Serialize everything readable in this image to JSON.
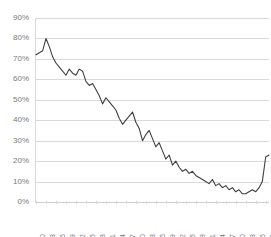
{
  "chart_data": {
    "type": "line",
    "title": "",
    "subtitle": "",
    "xlabel": "",
    "ylabel": "",
    "ylim": [
      0,
      90
    ],
    "y_ticks": [
      0,
      10,
      20,
      30,
      40,
      50,
      60,
      70,
      80,
      90
    ],
    "y_tick_labels": [
      "0%",
      "10%",
      "20%",
      "30%",
      "40%",
      "50%",
      "60%",
      "70%",
      "80%",
      "90%"
    ],
    "grid": true,
    "legend": null,
    "legend_position": "none",
    "x_tick_labels": [
      "1950",
      "1953",
      "1956",
      "1959",
      "1962",
      "1965",
      "1968",
      "1971",
      "1974",
      "1977",
      "1980",
      "1983",
      "1986",
      "1989",
      "1992",
      "1995",
      "1998",
      "2001",
      "2004",
      "2007",
      "2010",
      "2013",
      "2016",
      "2019"
    ],
    "xlim": [
      1950,
      2020
    ],
    "line_color": "#404040",
    "line_width": 1.1,
    "x": [
      1950,
      1951,
      1952,
      1953,
      1954,
      1955,
      1956,
      1957,
      1958,
      1959,
      1960,
      1961,
      1962,
      1963,
      1964,
      1965,
      1966,
      1967,
      1968,
      1969,
      1970,
      1971,
      1972,
      1973,
      1974,
      1975,
      1976,
      1977,
      1978,
      1979,
      1980,
      1981,
      1982,
      1983,
      1984,
      1985,
      1986,
      1987,
      1988,
      1989,
      1990,
      1991,
      1992,
      1993,
      1994,
      1995,
      1996,
      1997,
      1998,
      1999,
      2000,
      2001,
      2002,
      2003,
      2004,
      2005,
      2006,
      2007,
      2008,
      2009,
      2010,
      2011,
      2012,
      2013,
      2014,
      2015,
      2016,
      2017,
      2018,
      2019,
      2020
    ],
    "values": [
      72,
      73,
      74,
      80,
      76,
      71,
      68,
      66,
      64,
      62,
      65,
      63,
      62,
      65,
      64,
      59,
      57,
      58,
      55,
      52,
      48,
      51,
      49,
      47,
      45,
      41,
      38,
      40,
      42,
      44,
      39,
      36,
      30,
      33,
      35,
      31,
      27,
      29,
      25,
      21,
      23,
      18,
      20,
      17,
      15,
      16,
      14,
      15,
      13,
      12,
      11,
      10,
      9,
      11,
      8,
      9,
      7,
      8,
      6,
      7,
      5,
      6,
      4,
      4,
      5,
      6,
      5,
      7,
      10,
      22,
      23
    ],
    "value_unit": "%",
    "series": [
      {
        "name": "",
        "values": [
          72,
          73,
          74,
          80,
          76,
          71,
          68,
          66,
          64,
          62,
          65,
          63,
          62,
          65,
          64,
          59,
          57,
          58,
          55,
          52,
          48,
          51,
          49,
          47,
          45,
          41,
          38,
          40,
          42,
          44,
          39,
          36,
          30,
          33,
          35,
          31,
          27,
          29,
          25,
          21,
          23,
          18,
          20,
          17,
          15,
          16,
          14,
          15,
          13,
          12,
          11,
          10,
          9,
          11,
          8,
          9,
          7,
          8,
          6,
          7,
          5,
          6,
          4,
          4,
          5,
          6,
          5,
          7,
          10,
          22,
          23
        ]
      }
    ]
  },
  "axes": {
    "y_axis_name": "y-axis",
    "x_axis_name": "x-axis"
  }
}
